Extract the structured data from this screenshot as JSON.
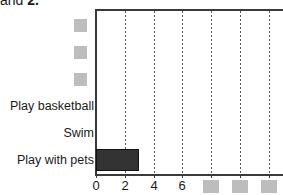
{
  "heading": {
    "text_prefix": "and ",
    "text_bold": "2.",
    "note": "partially cropped heading line at top of image"
  },
  "chart_data": {
    "type": "bar",
    "orientation": "horizontal",
    "title": "",
    "xlabel": "",
    "ylabel": "",
    "xlim": [
      0,
      13
    ],
    "grid": "vertical dotted gridlines",
    "legend": "none",
    "categories": [
      "[redacted]",
      "[redacted]",
      "[redacted]",
      "Play basketball",
      "Swim",
      "Play with pets"
    ],
    "values": [
      0,
      0,
      0,
      0,
      0,
      3
    ],
    "bars_visible": [
      {
        "category": "Play with pets",
        "value": 3
      }
    ],
    "x_ticks": [
      0,
      2,
      4,
      6,
      8,
      10,
      12
    ],
    "x_tick_labels": [
      "0",
      "2",
      "4",
      "6",
      "",
      "",
      ""
    ],
    "x_tick_labels_visible": [
      "0",
      "2",
      "4",
      "6"
    ],
    "x_tick_labels_redacted": 3,
    "category_labels_redacted": 3
  },
  "colors": {
    "bar_fill": "#333333",
    "bar_stroke": "#111111",
    "axis": "#3a3a3a",
    "gridline": "#555555",
    "redaction": "#bdbdbd",
    "text": "#1a1a1a",
    "background": "#ffffff"
  }
}
